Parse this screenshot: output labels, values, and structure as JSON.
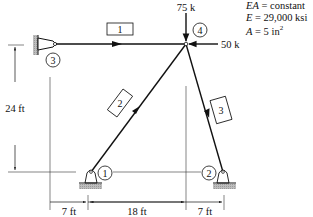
{
  "diagram": {
    "type": "truss",
    "properties": {
      "line1_var": "EA",
      "line1_rest": " = constant",
      "line2_var": "E",
      "line2_rest": " = 29,000 ksi",
      "line3_var": "A",
      "line3_rest": " = 5 in",
      "line3_sup": "2"
    },
    "loads": {
      "vertical": "75 k",
      "horizontal": "50 k"
    },
    "joints": {
      "j1": "1",
      "j2": "2",
      "j3": "3",
      "j4": "4"
    },
    "members": {
      "m1": "1",
      "m2": "2",
      "m3": "3"
    },
    "dimensions": {
      "height": "24 ft",
      "span_left": "7 ft",
      "span_mid": "18 ft",
      "span_right": "7 ft"
    }
  }
}
